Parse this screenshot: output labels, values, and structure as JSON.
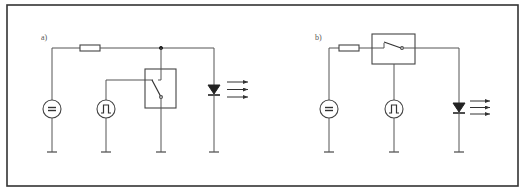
{
  "panels": [
    {
      "id": "a",
      "label": "a)",
      "components": [
        "dc-voltage-source",
        "resistor",
        "pulse-generator",
        "switch-box",
        "led"
      ],
      "topology": "Resistor in series from DC source to junction; switch box (controlled by pulse generator) shunts junction to ground; LED from junction to ground (parallel switching)"
    },
    {
      "id": "b",
      "label": "b)",
      "components": [
        "dc-voltage-source",
        "resistor",
        "switch-box",
        "pulse-generator",
        "led"
      ],
      "topology": "DC source through resistor into switch box; switch (controlled by pulse generator) connects series to LED (series switching)"
    }
  ],
  "symbols": {
    "dc_source": "=",
    "pulse_source": "pulse-waveform",
    "led_light": "three-arrows"
  },
  "colors": {
    "line": "#555555",
    "frame": "#333333",
    "background": "#ffffff"
  }
}
